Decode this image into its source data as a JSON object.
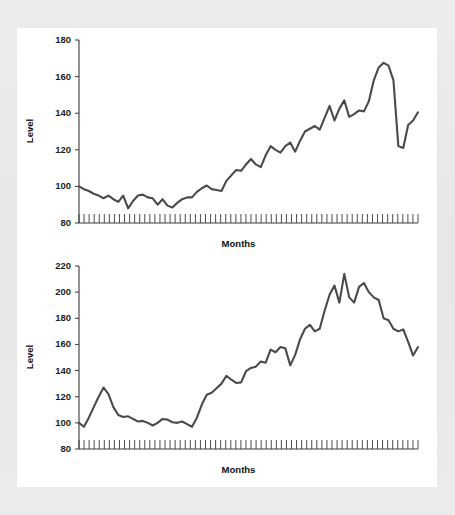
{
  "figure": {
    "background_color": "#e9e9e9",
    "panel_color": "#ffffff",
    "line_color": "#4a4a4a",
    "axis_color": "#3a3a3a"
  },
  "chart_data": [
    {
      "type": "line",
      "title": "",
      "xlabel": "Months",
      "ylabel": "Level",
      "ylim": [
        80,
        180
      ],
      "yticks": [
        80,
        100,
        120,
        140,
        160,
        180
      ],
      "ytick_labels": [
        "80",
        "100",
        "120",
        "140",
        "160",
        "180"
      ],
      "xlim": [
        0,
        67
      ],
      "x_tick_count": 68,
      "x_tick_labels_shown": false,
      "grid": false,
      "legend": false,
      "series": [
        {
          "name": "Level",
          "values": [
            100.0,
            98.5,
            97.5,
            96.0,
            95.0,
            93.5,
            95.0,
            93.0,
            91.5,
            95.0,
            88.0,
            92.0,
            95.0,
            95.5,
            94.0,
            93.5,
            90.0,
            93.0,
            89.5,
            88.5,
            91.0,
            93.0,
            94.0,
            94.0,
            97.0,
            99.0,
            100.5,
            98.5,
            98.0,
            97.5,
            103.0,
            106.0,
            109.0,
            108.5,
            112.0,
            115.0,
            112.0,
            110.5,
            117.0,
            122.0,
            120.0,
            118.5,
            122.0,
            124.0,
            119.0,
            125.0,
            130.0,
            131.5,
            133.0,
            131.0,
            137.5,
            144.0,
            136.0,
            142.5,
            147.0,
            138.0,
            139.5,
            141.5,
            141.0,
            146.5,
            158.0,
            165.0,
            167.5,
            166.0,
            158.0,
            122.0,
            121.0,
            133.5,
            136.0,
            140.5
          ]
        }
      ]
    },
    {
      "type": "line",
      "title": "",
      "xlabel": "Months",
      "ylabel": "Level",
      "ylim": [
        80,
        220
      ],
      "yticks": [
        80,
        100,
        120,
        140,
        160,
        180,
        200,
        220
      ],
      "ytick_labels": [
        "80",
        "100",
        "120",
        "140",
        "160",
        "180",
        "200",
        "220"
      ],
      "xlim": [
        0,
        67
      ],
      "x_tick_count": 68,
      "x_tick_labels_shown": false,
      "grid": false,
      "legend": false,
      "series": [
        {
          "name": "Level",
          "values": [
            100.0,
            97.0,
            104.0,
            112.0,
            120.0,
            127.0,
            122.0,
            112.0,
            106.0,
            104.5,
            105.0,
            103.0,
            101.0,
            101.5,
            100.0,
            98.0,
            100.0,
            103.0,
            102.5,
            100.5,
            100.0,
            101.0,
            99.0,
            97.0,
            104.0,
            114.0,
            121.5,
            123.0,
            126.5,
            130.0,
            136.0,
            133.0,
            130.5,
            131.0,
            139.5,
            142.0,
            143.0,
            147.0,
            146.0,
            156.0,
            154.0,
            158.0,
            157.0,
            144.0,
            152.0,
            164.0,
            172.0,
            175.0,
            170.0,
            172.0,
            186.0,
            198.0,
            205.0,
            192.0,
            214.0,
            196.0,
            192.0,
            204.0,
            207.0,
            200.0,
            196.0,
            194.0,
            180.0,
            178.5,
            172.0,
            170.0,
            171.5,
            162.0,
            151.5,
            158.0
          ]
        }
      ]
    }
  ]
}
